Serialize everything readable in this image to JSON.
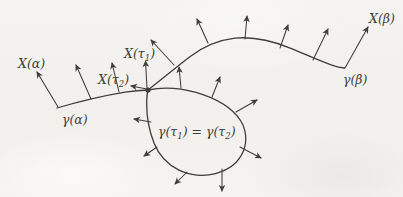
{
  "figure": {
    "background": "#f2f1ee",
    "ink": "#3f3e3c",
    "labels": {
      "x_alpha": {
        "pre": "X(α)"
      },
      "x_tau2": {
        "pre": "X(τ",
        "sub": "2",
        "post": ")"
      },
      "x_tau1": {
        "pre": "X(τ",
        "sub": "1",
        "post": ")"
      },
      "x_beta": {
        "pre": "X(β)"
      },
      "gamma_alpha": {
        "pre": "γ(α)"
      },
      "gamma_beta": {
        "pre": "γ(β)"
      },
      "gamma_eq": {
        "p1": "γ(τ",
        "s1": "1",
        "p2": ") = γ(τ",
        "s2": "2",
        "p3": ")"
      }
    },
    "label_positions": {
      "x_alpha": {
        "x": 18,
        "y": 68
      },
      "x_tau2": {
        "x": 98,
        "y": 84
      },
      "x_tau1": {
        "x": 124,
        "y": 58
      },
      "x_beta": {
        "x": 369,
        "y": 23
      },
      "gamma_alpha": {
        "x": 62,
        "y": 124
      },
      "gamma_beta": {
        "x": 343,
        "y": 84
      },
      "gamma_eq": {
        "x": 158,
        "y": 136
      }
    },
    "paths": {
      "left": "M 57,108 C 76,102.5 102,96 125,92.2 C 133,90.9 141.5,90.1 148,90",
      "loop": "M 148,90 C 161,87.2 179,87.6 196,92.4 C 214.5,97.8 232,107.5 240.5,120.5 C 246,129 247.5,140.5 243.5,150.8 C 239,162 228.5,170.2 215.5,173.6 C 204,176.6 190,175.7 179,170.2 C 168,164.7 158.8,155.2 154,143 C 149.3,131 146.6,115.5 146.7,103.5 C 146.7,98.3 147.2,93.2 148,90 Z",
      "top": "M 148,90 C 159,81.5 174,69 189.5,57 C 202,47.5 217,40.3 235,38.2 C 252.5,36.3 270,40 289.5,47.8 C 305,54 321,61.5 332.5,65.3 C 337,66.8 341,67.6 344.5,68"
    },
    "dot": {
      "cx": 148,
      "cy": 90,
      "r": 2.6
    },
    "arrows": [
      {
        "name": "x-alpha-arrow",
        "x1": 58,
        "y1": 107,
        "x2": 37,
        "y2": 72
      },
      {
        "name": "vector-arrow",
        "x1": 91,
        "y1": 99,
        "x2": 76,
        "y2": 65
      },
      {
        "name": "vector-arrow",
        "x1": 119,
        "y1": 92,
        "x2": 112,
        "y2": 63
      },
      {
        "name": "x-tau2-arrow",
        "x1": 147,
        "y1": 89,
        "x2": 131,
        "y2": 86
      },
      {
        "name": "x-tau1-arrow",
        "x1": 147,
        "y1": 88,
        "x2": 145.5,
        "y2": 61
      },
      {
        "name": "vector-arrow",
        "x1": 174,
        "y1": 65,
        "x2": 151,
        "y2": 40
      },
      {
        "name": "vector-arrow",
        "x1": 208,
        "y1": 43,
        "x2": 197,
        "y2": 19
      },
      {
        "name": "vector-arrow",
        "x1": 245,
        "y1": 39,
        "x2": 247,
        "y2": 16
      },
      {
        "name": "vector-arrow",
        "x1": 280,
        "y1": 48,
        "x2": 288,
        "y2": 25
      },
      {
        "name": "vector-arrow",
        "x1": 313,
        "y1": 60,
        "x2": 328,
        "y2": 29
      },
      {
        "name": "x-beta-arrow",
        "x1": 345,
        "y1": 68,
        "x2": 368,
        "y2": 27
      },
      {
        "name": "vector-arrow",
        "x1": 181,
        "y1": 88,
        "x2": 179,
        "y2": 67
      },
      {
        "name": "vector-arrow",
        "x1": 212,
        "y1": 97,
        "x2": 220,
        "y2": 77
      },
      {
        "name": "vector-arrow",
        "x1": 236,
        "y1": 112,
        "x2": 257,
        "y2": 100
      },
      {
        "name": "vector-arrow",
        "x1": 240,
        "y1": 147,
        "x2": 261,
        "y2": 158
      },
      {
        "name": "vector-arrow",
        "x1": 222,
        "y1": 169,
        "x2": 222,
        "y2": 191
      },
      {
        "name": "vector-arrow",
        "x1": 187,
        "y1": 172,
        "x2": 175,
        "y2": 184
      },
      {
        "name": "vector-arrow",
        "x1": 157,
        "y1": 147,
        "x2": 144,
        "y2": 156
      },
      {
        "name": "vector-arrow",
        "x1": 151,
        "y1": 122,
        "x2": 134,
        "y2": 119
      }
    ]
  }
}
